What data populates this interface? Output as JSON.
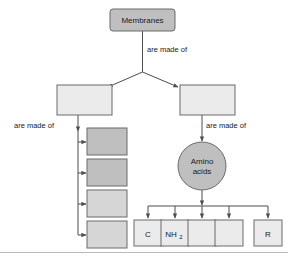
{
  "canvas": {
    "width": 288,
    "height": 259,
    "background": "#ffffff"
  },
  "colors": {
    "box_fill_light": "#ebebeb",
    "box_fill_medium": "#d6d6d6",
    "box_fill_dark": "#bfbfbf",
    "box_stroke": "#6b6b6b",
    "connector": "#4d4d4d",
    "text": "#1a1a1a",
    "rule": "#b9b9b9"
  },
  "diagram": {
    "type": "concept-map",
    "root": {
      "id": "membranes",
      "label": "Membranes",
      "shape": "rounded-rect",
      "fill": "#bfbfbf"
    },
    "edge_labels": [
      {
        "id": "edge-label-root",
        "text": "are made of"
      },
      {
        "id": "edge-label-left",
        "text": "are made of"
      },
      {
        "id": "edge-label-right",
        "text": "are made of"
      }
    ],
    "level2": [
      {
        "id": "left-branch-box",
        "label": "",
        "shape": "rect",
        "fill": "#ebebeb"
      },
      {
        "id": "right-branch-box",
        "label": "",
        "shape": "rect",
        "fill": "#ebebeb"
      }
    ],
    "left_children": [
      {
        "id": "left-child-1",
        "label": "",
        "shape": "rect",
        "fill": "#bfbfbf"
      },
      {
        "id": "left-child-2",
        "label": "",
        "shape": "rect",
        "fill": "#bfbfbf"
      },
      {
        "id": "left-child-3",
        "label": "",
        "shape": "rect",
        "fill": "#d6d6d6"
      },
      {
        "id": "left-child-4",
        "label": "",
        "shape": "rect",
        "fill": "#d6d6d6"
      }
    ],
    "right_node": {
      "id": "amino-acids",
      "label_line1": "Amino",
      "label_line2": "acids",
      "shape": "ellipse",
      "fill": "#bfbfbf"
    },
    "bottom_children": [
      {
        "id": "bottom-child-c",
        "label": "C",
        "subscript": "",
        "fill": "#ebebeb"
      },
      {
        "id": "bottom-child-nh2",
        "label": "NH",
        "subscript": "2",
        "fill": "#ebebeb"
      },
      {
        "id": "bottom-child-3",
        "label": "",
        "subscript": "",
        "fill": "#ebebeb"
      },
      {
        "id": "bottom-child-4",
        "label": "",
        "subscript": "",
        "fill": "#ebebeb"
      },
      {
        "id": "bottom-child-r",
        "label": "R",
        "subscript": "",
        "fill": "#ebebeb"
      }
    ]
  }
}
